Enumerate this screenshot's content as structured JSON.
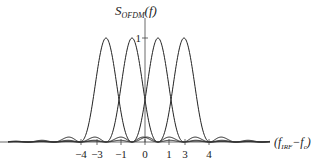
{
  "chart_data": {
    "type": "line",
    "title": "",
    "ylabel_main": "S",
    "ylabel_sub": "OFDM",
    "ylabel_arg": "(f)",
    "xlabel_open": "(f",
    "xlabel_sub": "IRF",
    "xlabel_rest": "−f",
    "xlabel_sub2": "c",
    "xlabel_close": ")",
    "y_tick_label": "1",
    "x_ticks": [
      "−4",
      "−3",
      "−1",
      "0",
      "1",
      "3",
      "4"
    ],
    "series": [
      {
        "name": "subcarrier-1",
        "center": -3,
        "peak": 1
      },
      {
        "name": "subcarrier-2",
        "center": -1,
        "peak": 1
      },
      {
        "name": "subcarrier-3",
        "center": 1,
        "peak": 1
      },
      {
        "name": "subcarrier-4",
        "center": 3,
        "peak": 1
      }
    ],
    "function": "sinc^2",
    "grid": false,
    "legend": false
  },
  "colors": {
    "line": "#222222",
    "axis": "#444444",
    "background": "#ffffff"
  }
}
